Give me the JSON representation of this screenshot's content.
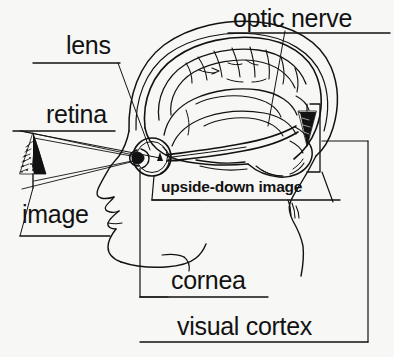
{
  "figure": {
    "background_color": "#f7f7f5",
    "ink_color": "#121212",
    "width": 394,
    "height": 357
  },
  "labels": {
    "lens": "lens",
    "optic_nerve": "optic nerve",
    "retina": "retina",
    "image": "image",
    "upside_down_image": "upside-down image",
    "cornea": "cornea",
    "visual_cortex": "visual cortex"
  },
  "parts": {
    "head_profile": "head-profile-outline",
    "brain": "brain-outline",
    "eyeball": "eyeball",
    "pupil": "pupil",
    "lens_body": "eye-lens",
    "optic_nerve_tract": "optic-nerve-tract",
    "object_tree": "fir-tree-object",
    "cortex_tree": "inverted-fir-tree-in-cortex",
    "light_rays": "light-ray-cone",
    "cortex_bracket": "visual-cortex-bracket"
  }
}
